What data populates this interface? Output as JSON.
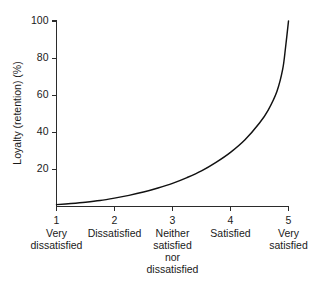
{
  "chart_data": {
    "type": "line",
    "title": "",
    "subtitle": "",
    "xlabel": "",
    "ylabel": "Loyalty (retention) (%)",
    "xlim": [
      1,
      5
    ],
    "ylim": [
      0,
      100
    ],
    "grid": false,
    "legend": "none",
    "x_tick_labels": [
      "1",
      "2",
      "3",
      "4",
      "5"
    ],
    "x_category_labels": [
      "Very\ndissatisfied",
      "Dissatisfied",
      "Neither\nsatisfied\nnor\ndissatisfied",
      "Satisfied",
      "Very\nsatisfied"
    ],
    "y_tick_labels": [
      "20",
      "40",
      "60",
      "80",
      "100"
    ],
    "y_tick_values": [
      20,
      40,
      60,
      80,
      100
    ],
    "series": [
      {
        "name": "Loyalty curve",
        "color": "#111111",
        "x": [
          1.0,
          1.25,
          1.5,
          1.75,
          2.0,
          2.25,
          2.5,
          2.75,
          3.0,
          3.25,
          3.5,
          3.75,
          4.0,
          4.25,
          4.5,
          4.65,
          4.8,
          4.9,
          4.95,
          5.0
        ],
        "values": [
          1.0,
          1.6,
          2.3,
          3.2,
          4.5,
          6.0,
          7.8,
          10.0,
          12.5,
          15.6,
          19.2,
          23.8,
          29.2,
          36.0,
          45.0,
          52.0,
          62.0,
          74.0,
          86.0,
          100.0
        ]
      }
    ],
    "annotations": []
  },
  "axis_labels": {
    "x_ticks": [
      {
        "value": "1",
        "category": [
          "Very",
          "dissatisfied"
        ]
      },
      {
        "value": "2",
        "category": [
          "Dissatisfied"
        ]
      },
      {
        "value": "3",
        "category": [
          "Neither",
          "satisfied",
          "nor",
          "dissatisfied"
        ]
      },
      {
        "value": "4",
        "category": [
          "Satisfied"
        ]
      },
      {
        "value": "5",
        "category": [
          "Very",
          "satisfied"
        ]
      }
    ]
  },
  "colors": {
    "background": "#ffffff",
    "axis": "#2b2b2b",
    "curve": "#111111",
    "text": "#1a1a1a"
  }
}
